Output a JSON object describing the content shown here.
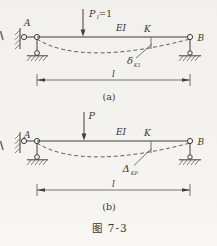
{
  "colors": {
    "background": "#f3f2ef",
    "line": "#3f3e3a",
    "text": "#3a3934"
  },
  "caption": "图 7-3",
  "a": {
    "node_left": "A",
    "node_right": "B",
    "load_base": "P",
    "load_sub": "1",
    "load_rest": "=1",
    "stiffness": "EI",
    "point": "K",
    "deflection_base": "δ",
    "deflection_sub": "K1",
    "span": "l",
    "tag": "(a)"
  },
  "b": {
    "node_left": "A",
    "node_right": "B",
    "load_base": "P",
    "stiffness": "EI",
    "point": "K",
    "deflection_base": "Δ",
    "deflection_sub": "KP",
    "span": "l",
    "tag": "(b)"
  }
}
